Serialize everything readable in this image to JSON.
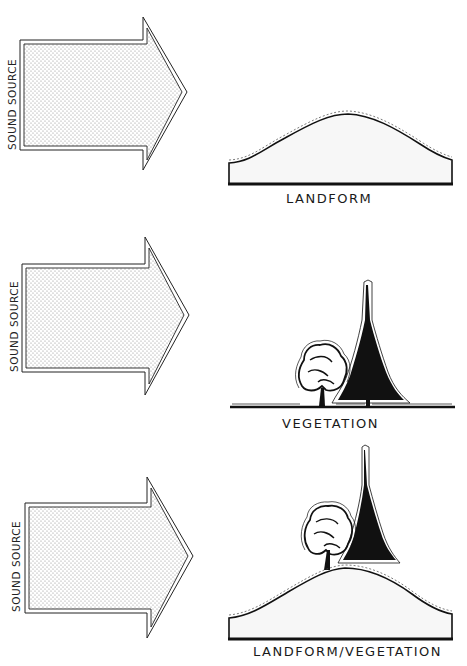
{
  "colors": {
    "ink": "#111111",
    "paper": "#ffffff",
    "stipple": "#9a9a9a",
    "landform_fill": "#f6f6f6"
  },
  "panels": [
    {
      "id": "landform",
      "source_label": "SOUND SOURCE",
      "caption": "LANDFORM",
      "barrier": "landform"
    },
    {
      "id": "vegetation",
      "source_label": "SOUND SOURCE",
      "caption": "VEGETATION",
      "barrier": "vegetation"
    },
    {
      "id": "landform-vegetation",
      "source_label": "SOUND SOURCE",
      "caption": "LANDFORM/VEGETATION",
      "barrier": "landform+vegetation"
    }
  ]
}
